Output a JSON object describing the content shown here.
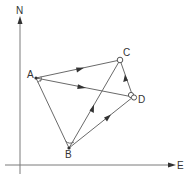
{
  "diagram": {
    "type": "directed-graph-on-compass-axes",
    "axes": {
      "vertical_label": "N",
      "horizontal_label": "E"
    },
    "nodes": [
      {
        "id": "A",
        "label": "A",
        "x": 36,
        "y": 78
      },
      {
        "id": "B",
        "label": "B",
        "x": 69,
        "y": 148
      },
      {
        "id": "C",
        "label": "C",
        "x": 120,
        "y": 60
      },
      {
        "id": "D",
        "label": "D",
        "x": 133,
        "y": 97
      }
    ],
    "edges": [
      {
        "from": "A",
        "to": "C",
        "directed": true
      },
      {
        "from": "A",
        "to": "D",
        "directed": true
      },
      {
        "from": "A",
        "to": "B",
        "directed": false
      },
      {
        "from": "B",
        "to": "C",
        "directed": true
      },
      {
        "from": "B",
        "to": "D",
        "directed": true
      },
      {
        "from": "D",
        "to": "C",
        "directed": true
      }
    ],
    "colors": {
      "line": "#6a6a6a",
      "arrowhead": "#333333",
      "text": "#333333",
      "background": "#ffffff"
    }
  }
}
